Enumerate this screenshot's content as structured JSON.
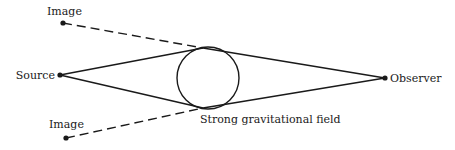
{
  "diagram": {
    "colors": {
      "stroke": "#1a1a1a",
      "background": "#ffffff"
    },
    "nodes": {
      "source": {
        "label": "Source",
        "x": 60,
        "y": 75
      },
      "observer": {
        "label": "Observer",
        "x": 385,
        "y": 78
      },
      "image_top": {
        "label": "Image",
        "x": 63,
        "y": 23
      },
      "image_bottom": {
        "label": "Image",
        "x": 66,
        "y": 138
      }
    },
    "lens": {
      "label": "Strong gravitational field",
      "cx": 208,
      "cy": 78,
      "r": 31
    },
    "tangent_points": {
      "top": {
        "x": 203,
        "y": 48
      },
      "bottom": {
        "x": 203,
        "y": 108
      }
    },
    "edges": [
      {
        "from": "source",
        "to": "tangent_top",
        "style": "solid"
      },
      {
        "from": "source",
        "to": "tangent_bottom",
        "style": "solid"
      },
      {
        "from": "tangent_top",
        "to": "observer",
        "style": "solid"
      },
      {
        "from": "tangent_bottom",
        "to": "observer",
        "style": "solid"
      },
      {
        "from": "image_top",
        "to": "tangent_top",
        "style": "dashed"
      },
      {
        "from": "image_bottom",
        "to": "tangent_bottom",
        "style": "dashed"
      }
    ]
  }
}
